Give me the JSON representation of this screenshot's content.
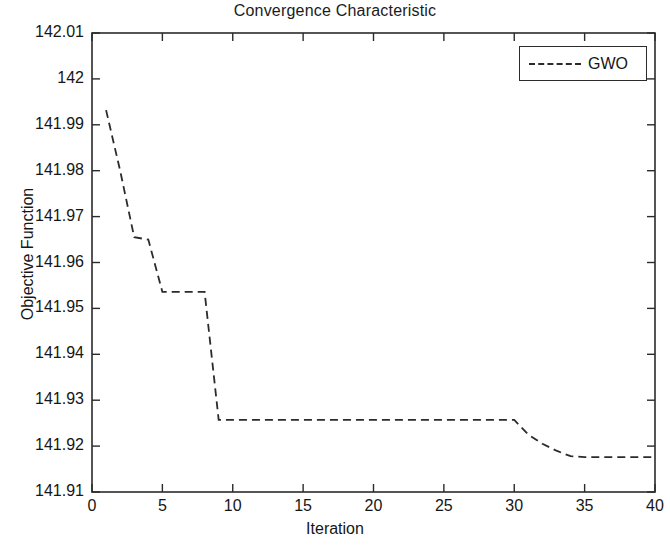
{
  "chart_data": {
    "type": "line",
    "title": "Convergence Characteristic",
    "xlabel": "Iteration",
    "ylabel": "Objective Function",
    "xlim": [
      0,
      40
    ],
    "ylim": [
      141.91,
      142.01
    ],
    "xticks": [
      0,
      5,
      10,
      15,
      20,
      25,
      30,
      35,
      40
    ],
    "xtick_labels": [
      "0",
      "5",
      "10",
      "15",
      "20",
      "25",
      "30",
      "35",
      "40"
    ],
    "yticks": [
      141.91,
      141.92,
      141.93,
      141.94,
      141.95,
      141.96,
      141.97,
      141.98,
      141.99,
      142,
      142.01
    ],
    "ytick_labels": [
      "141.91",
      "141.92",
      "141.93",
      "141.94",
      "141.95",
      "141.96",
      "141.97",
      "141.98",
      "141.99",
      "142",
      "142.01"
    ],
    "grid": false,
    "legend_position": "top-right",
    "legend": [
      "GWO"
    ],
    "series": [
      {
        "name": "GWO",
        "color": "#2b2b2b",
        "linestyle": "dashed",
        "x": [
          1,
          2,
          3,
          4,
          5,
          6,
          7,
          8,
          9,
          10,
          11,
          12,
          13,
          14,
          15,
          16,
          17,
          18,
          19,
          20,
          21,
          22,
          23,
          24,
          25,
          26,
          27,
          28,
          29,
          30,
          31,
          32,
          33,
          34,
          35,
          36,
          37,
          38,
          39,
          40
        ],
        "values": [
          141.9932,
          141.98,
          141.9655,
          141.965,
          141.9536,
          141.9536,
          141.9536,
          141.9536,
          141.9257,
          141.9257,
          141.9257,
          141.9257,
          141.9257,
          141.9257,
          141.9257,
          141.9257,
          141.9257,
          141.9257,
          141.9257,
          141.9257,
          141.9257,
          141.9257,
          141.9257,
          141.9257,
          141.9257,
          141.9257,
          141.9257,
          141.9257,
          141.9257,
          141.9257,
          141.9225,
          141.9205,
          141.919,
          141.9178,
          141.9176,
          141.9176,
          141.9176,
          141.9176,
          141.9176,
          141.9176
        ]
      }
    ]
  },
  "legend_label": "GWO"
}
